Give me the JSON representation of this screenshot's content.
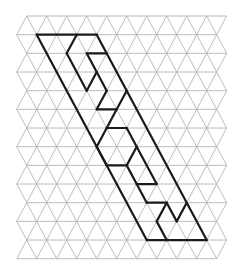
{
  "figure": {
    "grid": {
      "rows": 13,
      "half_step_px": 10.0,
      "row_height_px": 18.67,
      "origin_x": 16.7,
      "origin_y": 16,
      "min_c": 0,
      "max_c": 21,
      "grid_color": "#b4b4b4"
    },
    "bold_color": "#1a1a1a",
    "bold_segments": [
      [
        [
          1,
          2
        ],
        [
          1,
          8
        ]
      ],
      [
        [
          1,
          2
        ],
        [
          12,
          13
        ]
      ],
      [
        [
          1,
          8
        ],
        [
          12,
          19
        ]
      ],
      [
        [
          12,
          13
        ],
        [
          12,
          19
        ]
      ],
      [
        [
          1,
          6
        ],
        [
          2,
          5
        ]
      ],
      [
        [
          2,
          5
        ],
        [
          4,
          7
        ]
      ],
      [
        [
          2,
          7
        ],
        [
          2,
          9
        ]
      ],
      [
        [
          2,
          7
        ],
        [
          4,
          9
        ]
      ],
      [
        [
          3,
          8
        ],
        [
          4,
          7
        ]
      ],
      [
        [
          4,
          9
        ],
        [
          5,
          8
        ]
      ],
      [
        [
          5,
          8
        ],
        [
          5,
          10
        ]
      ],
      [
        [
          5,
          10
        ],
        [
          4,
          11
        ]
      ],
      [
        [
          5,
          10
        ],
        [
          6,
          9
        ]
      ],
      [
        [
          6,
          9
        ],
        [
          6,
          11
        ]
      ],
      [
        [
          6,
          9
        ],
        [
          7,
          8
        ]
      ],
      [
        [
          7,
          8
        ],
        [
          8,
          9
        ]
      ],
      [
        [
          8,
          9
        ],
        [
          8,
          11
        ]
      ],
      [
        [
          6,
          11
        ],
        [
          7,
          12
        ]
      ],
      [
        [
          7,
          12
        ],
        [
          8,
          11
        ]
      ],
      [
        [
          7,
          12
        ],
        [
          9,
          14
        ]
      ],
      [
        [
          8,
          11
        ],
        [
          9,
          12
        ]
      ],
      [
        [
          9,
          12
        ],
        [
          9,
          14
        ]
      ],
      [
        [
          9,
          12
        ],
        [
          10,
          13
        ]
      ],
      [
        [
          10,
          13
        ],
        [
          10,
          15
        ]
      ],
      [
        [
          10,
          15
        ],
        [
          11,
          16
        ]
      ],
      [
        [
          11,
          16
        ],
        [
          10,
          17
        ]
      ],
      [
        [
          10,
          15
        ],
        [
          11,
          14
        ]
      ],
      [
        [
          11,
          14
        ],
        [
          12,
          15
        ]
      ]
    ]
  }
}
